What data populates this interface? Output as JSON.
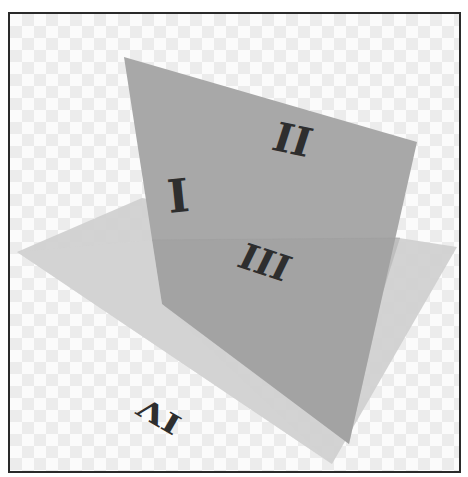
{
  "figure": {
    "colors": {
      "background_checker_light": "#fbfbfb",
      "background_checker_dark": "#ececec",
      "frame_border": "#2a2a2a",
      "vertical_plane": "#a9a9a9",
      "horizontal_plane": "#cdcdcd",
      "overlap_region": "#9c9c9c",
      "numeral": "#2e2e2e"
    },
    "quadrant_labels": {
      "q1": "I",
      "q2": "II",
      "q3": "III",
      "q4": "IV"
    }
  }
}
